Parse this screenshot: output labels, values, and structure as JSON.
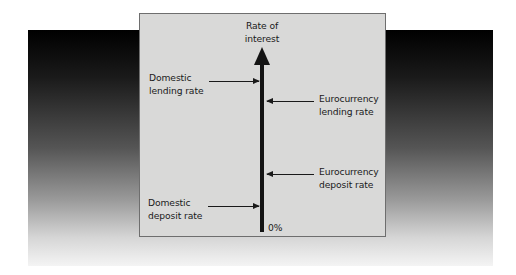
{
  "diagram": {
    "axis": {
      "title_line1": "Rate of",
      "title_line2": "interest",
      "origin_label": "0%",
      "direction": "up"
    },
    "markers": [
      {
        "side": "left",
        "line1": "Domestic",
        "line2": "lending rate",
        "order_from_top": 1
      },
      {
        "side": "right",
        "line1": "Eurocurrency",
        "line2": "lending rate",
        "order_from_top": 2
      },
      {
        "side": "right",
        "line1": "Eurocurrency",
        "line2": "deposit rate",
        "order_from_top": 3
      },
      {
        "side": "left",
        "line1": "Domestic",
        "line2": "deposit rate",
        "order_from_top": 4
      }
    ],
    "colors": {
      "panel_fill": "#d9d9d8",
      "panel_border": "#6e6e6e",
      "axis": "#141414",
      "backdrop_top": "#000000",
      "backdrop_bottom": "#f4f4f4"
    }
  }
}
